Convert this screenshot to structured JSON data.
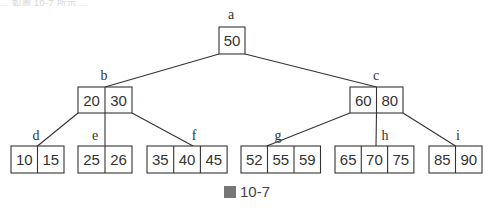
{
  "top_strip_text": "... 如圖 10-7 所示 ...",
  "caption": {
    "text": "10-7",
    "prefix_glyph": "圖"
  },
  "colors": {
    "stroke": "#333333",
    "text": "#333333",
    "background": "#ffffff"
  },
  "tree": {
    "type": "b-tree",
    "order": 4,
    "nodes": [
      {
        "id": "a",
        "label": "a",
        "keys": [
          "50"
        ],
        "level": 0,
        "children": [
          "b",
          "c"
        ]
      },
      {
        "id": "b",
        "label": "b",
        "keys": [
          "20",
          "30"
        ],
        "level": 1,
        "children": [
          "d",
          "e",
          "f"
        ]
      },
      {
        "id": "c",
        "label": "c",
        "keys": [
          "60",
          "80"
        ],
        "level": 1,
        "children": [
          "g",
          "h",
          "i"
        ]
      },
      {
        "id": "d",
        "label": "d",
        "keys": [
          "10",
          "15"
        ],
        "level": 2,
        "children": []
      },
      {
        "id": "e",
        "label": "e",
        "keys": [
          "25",
          "26"
        ],
        "level": 2,
        "children": []
      },
      {
        "id": "f",
        "label": "f",
        "keys": [
          "35",
          "40",
          "45"
        ],
        "level": 2,
        "children": []
      },
      {
        "id": "g",
        "label": "g",
        "keys": [
          "52",
          "55",
          "59"
        ],
        "level": 2,
        "children": []
      },
      {
        "id": "h",
        "label": "h",
        "keys": [
          "65",
          "70",
          "75"
        ],
        "level": 2,
        "children": []
      },
      {
        "id": "i",
        "label": "i",
        "keys": [
          "85",
          "90"
        ],
        "level": 2,
        "children": []
      }
    ]
  }
}
